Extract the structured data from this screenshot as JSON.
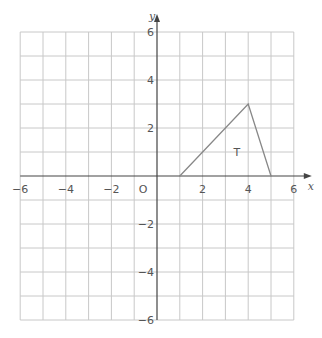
{
  "diagram": {
    "x_axis": {
      "label": "x",
      "min": -6,
      "max": 6,
      "tick_labels": [
        "-6",
        "-4",
        "-2",
        "2",
        "4",
        "6"
      ]
    },
    "y_axis": {
      "label": "y",
      "min": -6,
      "max": 6,
      "tick_labels": [
        "6",
        "4",
        "2",
        "-2",
        "-4",
        "-6"
      ]
    },
    "origin_label": "O",
    "shape": {
      "label": "T",
      "vertices": [
        [
          1,
          0
        ],
        [
          4,
          3
        ],
        [
          5,
          0
        ]
      ]
    },
    "colors": {
      "grid": "#c8c8c8",
      "axis": "#444444",
      "shape": "#888888"
    }
  }
}
